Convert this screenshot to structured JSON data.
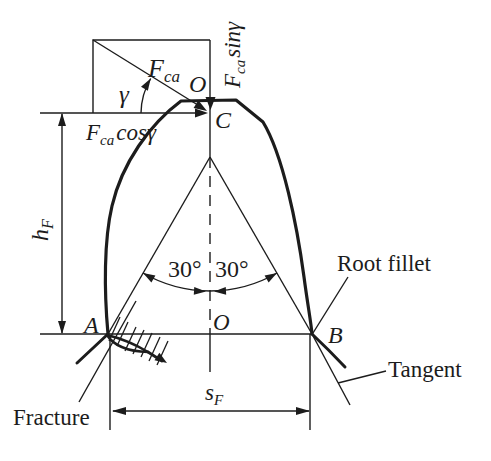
{
  "colors": {
    "ink": "#1c1c1c",
    "background": "#ffffff"
  },
  "labels": {
    "force_symbol": "F",
    "force_subscript": "ca",
    "cos_component": "cosγ",
    "sin_component": "sinγ",
    "gamma_angle": "γ",
    "point_tip": "O",
    "point_load": "C",
    "point_root_left": "A",
    "point_root_center": "O",
    "point_root_right": "B",
    "height_symbol": "h",
    "height_subscript": "F",
    "width_symbol": "s",
    "width_subscript": "F",
    "angle_left": "30°",
    "angle_right": "30°",
    "root_fillet": "Root fillet",
    "tangent": "Tangent",
    "fracture": "Fracture"
  }
}
